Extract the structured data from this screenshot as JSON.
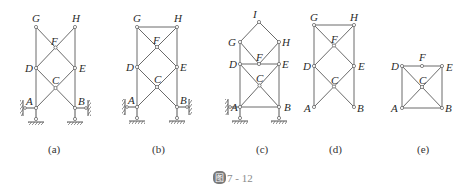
{
  "figure": {
    "caption_badge": "图",
    "caption_number": "7 - 12"
  },
  "subfigures": [
    {
      "id": "a",
      "label": "(a)",
      "nodes": {
        "G": "G",
        "H": "H",
        "F": "F",
        "D": "D",
        "E": "E",
        "C": "C",
        "A": "A",
        "B": "B"
      }
    },
    {
      "id": "b",
      "label": "(b)",
      "nodes": {
        "G": "G",
        "H": "H",
        "F": "F",
        "D": "D",
        "E": "E",
        "C": "C",
        "A": "A",
        "B": "B"
      }
    },
    {
      "id": "c",
      "label": "(c)",
      "nodes": {
        "I": "I",
        "G": "G",
        "H": "H",
        "F": "F",
        "D": "D",
        "E": "E",
        "C": "C",
        "A": "A",
        "B": "B"
      }
    },
    {
      "id": "d",
      "label": "(d)",
      "nodes": {
        "G": "G",
        "H": "H",
        "F": "F",
        "D": "D",
        "E": "E",
        "C": "C",
        "A": "A",
        "B": "B"
      }
    },
    {
      "id": "e",
      "label": "(e)",
      "nodes": {
        "D": "D",
        "F": "F",
        "E": "E",
        "C": "C",
        "A": "A",
        "B": "B"
      }
    }
  ]
}
